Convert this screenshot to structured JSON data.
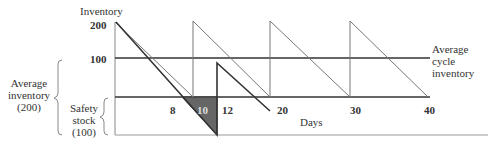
{
  "diagram": {
    "type": "inventory-sawtooth",
    "y_axis": {
      "title": "Inventory",
      "ticks": [
        "200",
        "100"
      ]
    },
    "x_axis": {
      "title": "Days",
      "ticks": [
        "8",
        "10",
        "12",
        "20",
        "30",
        "40"
      ]
    },
    "annotations": {
      "average_cycle_inventory": [
        "Average",
        "cycle",
        "inventory"
      ],
      "average_inventory": [
        "Average",
        "inventory",
        "(200)"
      ],
      "safety_stock": [
        "Safety",
        "stock",
        "(100)"
      ]
    },
    "colors": {
      "line": "#333333",
      "thin_line": "#777777",
      "stockout_fill": "#666666",
      "axis": "#888888"
    },
    "series": [
      {
        "name": "planned-cycle",
        "points": [
          [
            0,
            200
          ],
          [
            10,
            0
          ],
          [
            10,
            200
          ],
          [
            20,
            0
          ],
          [
            20,
            200
          ],
          [
            30,
            0
          ],
          [
            30,
            200
          ],
          [
            40,
            0
          ]
        ]
      },
      {
        "name": "actual-with-delay",
        "points": [
          [
            0,
            200
          ],
          [
            12,
            -100
          ],
          [
            12,
            100
          ],
          [
            20,
            0
          ]
        ]
      }
    ]
  }
}
